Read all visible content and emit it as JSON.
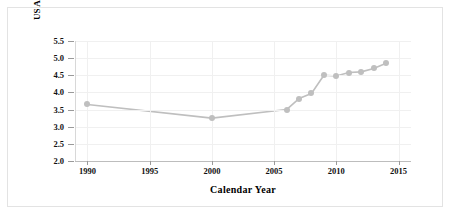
{
  "chart_data": {
    "type": "line",
    "title": "",
    "xlabel": "Calendar Year",
    "ylabel": "US Ag Imports/US Total Imports (%)",
    "xlim": [
      1989,
      2016
    ],
    "ylim": [
      2.0,
      5.5
    ],
    "grid": true,
    "legend": "none",
    "series": [
      {
        "name": "US Ag Imports/US Total Imports (%)",
        "color": "#bfbfbf",
        "marker": "circle",
        "x": [
          1990,
          2000,
          2006,
          2007,
          2008,
          2009,
          2010,
          2011,
          2012,
          2013,
          2014
        ],
        "values": [
          3.65,
          3.25,
          3.5,
          3.82,
          3.97,
          4.5,
          4.48,
          4.58,
          4.6,
          4.7,
          4.85
        ]
      }
    ],
    "x_ticks": [
      1990,
      1995,
      2000,
      2005,
      2010,
      2015
    ],
    "x_tick_labels": [
      "1990",
      "1995",
      "2000",
      "2005",
      "2010",
      "2015"
    ],
    "y_ticks": [
      2.0,
      2.5,
      3.0,
      3.5,
      4.0,
      4.5,
      5.0,
      5.5
    ],
    "y_tick_labels": [
      "2.0",
      "2.5",
      "3.0",
      "3.5",
      "4.0",
      "4.5",
      "5.0",
      "5.5"
    ]
  },
  "colors": {
    "series": "#bfbfbf",
    "grid": "#f0f0f0",
    "axis": "#bdbdbd",
    "tick": "#9a9a9a",
    "text": "#111111",
    "frame": "#e3e3e3"
  }
}
